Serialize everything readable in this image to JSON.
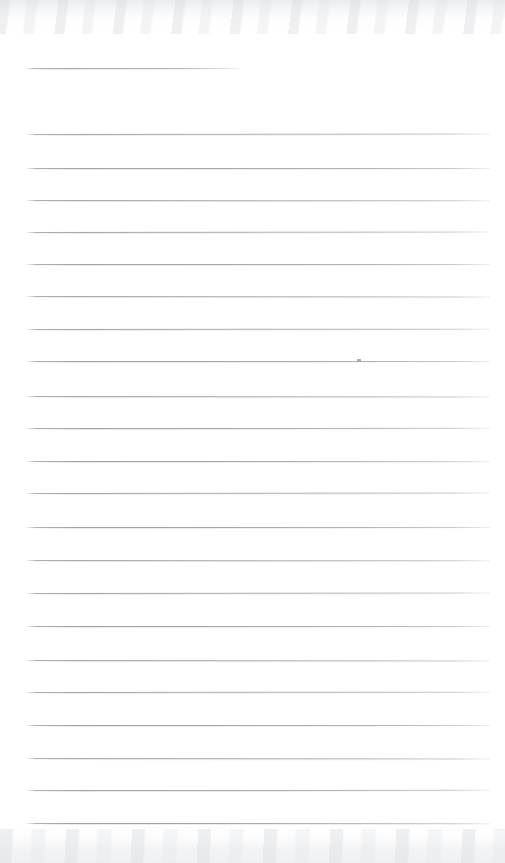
{
  "document": {
    "kind": "scanned-blank-ruled-notepad-page",
    "page_width": 505,
    "page_height": 863,
    "background_color": "#ffffff",
    "paper_tone": "#fdfdfe",
    "rule_color": "#a6aab0",
    "rule_shadow_color": "#cdd0d5",
    "written_text": "",
    "header_text": "",
    "body_text": "",
    "page_number": ""
  },
  "header_rule": {
    "label": "title-rule",
    "x": 27,
    "y": 68,
    "width": 213,
    "thickness": 1
  },
  "rules": {
    "label": "ruled-lines",
    "count": 22,
    "x": 27,
    "width": 463,
    "thickness": 1,
    "spacing": 32.4,
    "y_positions": [
      134,
      168,
      200,
      232,
      264,
      296,
      329,
      361,
      396,
      428,
      461,
      493,
      527,
      560,
      593,
      626,
      660,
      692,
      725,
      758,
      790,
      823
    ]
  },
  "marks": [
    {
      "label": "stray-pencil-dot",
      "x": 357,
      "y": 359,
      "width": 4,
      "height": 3,
      "color": "#a8aaae"
    }
  ],
  "scan_artifacts": {
    "top_edge_shadow_color": "#e8eaed",
    "bottom_edge_shadow_color": "#eaecef",
    "top_edge_height": 34,
    "bottom_edge_height": 34
  }
}
